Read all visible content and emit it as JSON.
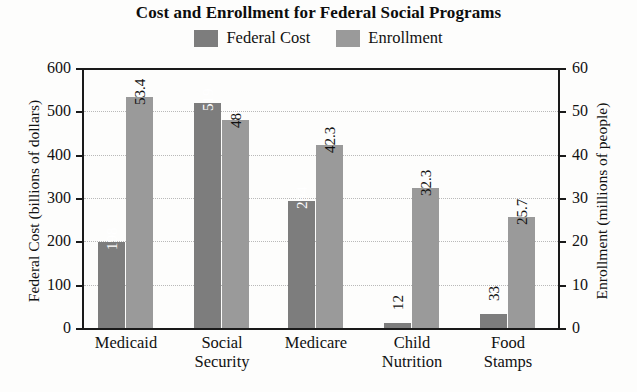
{
  "chart_data": {
    "type": "bar",
    "title": "Cost and Enrollment for Federal Social Programs",
    "categories": [
      "Medicaid",
      "Social Security",
      "Medicare",
      "Child Nutrition",
      "Food Stamps"
    ],
    "series": [
      {
        "name": "Federal Cost",
        "values": [
          198,
          519,
          294,
          12,
          33
        ],
        "axis": "left",
        "color": "#7d7d7d",
        "label_color": "#ffffff"
      },
      {
        "name": "Enrollment",
        "values": [
          53.4,
          48,
          42.3,
          32.3,
          25.7
        ],
        "axis": "right",
        "color": "#9a9a9a",
        "label_color": "#111111"
      }
    ],
    "xlabel": "",
    "ylabel": "Federal Cost (billions of dollars)",
    "y2label": "Enrollment (millions of people)",
    "ylim": [
      0,
      600
    ],
    "y2lim": [
      0,
      60
    ],
    "yticks": [
      "0",
      "100",
      "200",
      "300",
      "400",
      "500",
      "600"
    ],
    "y2ticks": [
      "0",
      "10",
      "20",
      "30",
      "40",
      "50",
      "60"
    ],
    "grid": true,
    "legend_position": "top-center"
  },
  "axes": {
    "left_title": "Federal Cost (billions of dollars)",
    "right_title": "Enrollment (millions of people)"
  },
  "legend": {
    "items": [
      {
        "label": "Federal Cost",
        "color": "#7d7d7d"
      },
      {
        "label": "Enrollment",
        "color": "#9a9a9a"
      }
    ]
  }
}
